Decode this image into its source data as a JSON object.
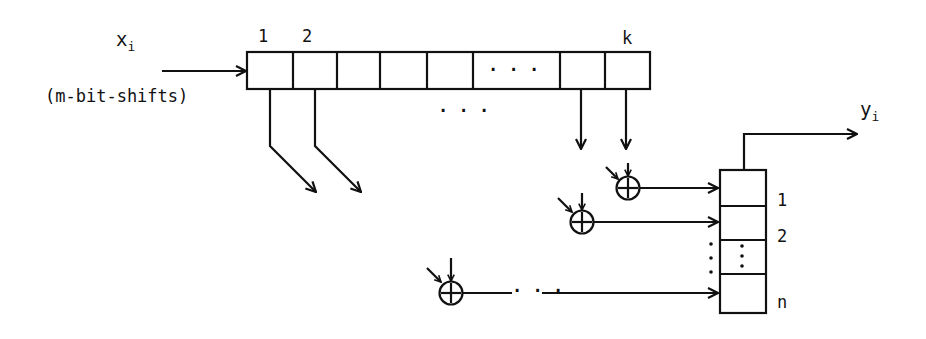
{
  "diagram": {
    "input": {
      "symbol": "x",
      "subscript": "i",
      "note": "(m-bit-shifts)"
    },
    "output": {
      "symbol": "y",
      "subscript": "i"
    },
    "shift_register": {
      "cell_labels": {
        "first": "1",
        "second": "2",
        "last": "k"
      },
      "inner_ellipsis": ". . .",
      "below_ellipsis": ". . ."
    },
    "output_register": {
      "row_labels": [
        "1",
        "2",
        "n"
      ],
      "ellipsis": ":"
    },
    "xor_symbol": "⊕",
    "line_ellipsis": "· · ·",
    "colors": {
      "ink": "#111111",
      "background": "#ffffff"
    }
  }
}
